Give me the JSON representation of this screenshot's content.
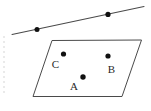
{
  "figure": {
    "type": "geometry-diagram",
    "background_color": "#ffffff",
    "stroke_color": "#4a4a4a",
    "point_color": "#111111",
    "label_color": "#2a2a2a",
    "canvas": {
      "width": 151,
      "height": 111
    },
    "line": {
      "name": "upper-line",
      "x1": 12,
      "y1": 34.5,
      "x2": 144,
      "y2": 6.5,
      "stroke_width": 1.1,
      "points": [
        {
          "id": "line-point-left",
          "cx": 37,
          "cy": 29.5,
          "r": 2.5,
          "label": ""
        },
        {
          "id": "line-point-right",
          "cx": 108,
          "cy": 14.4,
          "r": 2.6,
          "label": ""
        }
      ]
    },
    "parallelogram": {
      "name": "parallelogram",
      "stroke_width": 1.0,
      "fill": "none",
      "vertices": [
        {
          "id": "top-left",
          "x": 52,
          "y": 40.5
        },
        {
          "id": "top-right",
          "x": 141.5,
          "y": 40.0
        },
        {
          "id": "bottom-right",
          "x": 122,
          "y": 96.5
        },
        {
          "id": "bottom-left",
          "x": 33,
          "y": 96.5
        }
      ],
      "points": [
        {
          "id": "point-c",
          "label": "C",
          "cx": 63.5,
          "cy": 54.0,
          "r": 2.6,
          "label_x": 55.5,
          "label_y": 68.0,
          "label_anchor": "middle"
        },
        {
          "id": "point-b",
          "label": "B",
          "cx": 108.0,
          "cy": 56.0,
          "r": 2.6,
          "label_x": 111.5,
          "label_y": 73.0,
          "label_anchor": "middle"
        },
        {
          "id": "point-a",
          "label": "A",
          "cx": 83.0,
          "cy": 77.0,
          "r": 2.7,
          "label_x": 74.0,
          "label_y": 90.0,
          "label_anchor": "middle"
        }
      ]
    },
    "edge_artifact": {
      "name": "left-edge-artifact",
      "x": 4,
      "y_start": 36,
      "y_end": 94,
      "color": "#e2e2e2",
      "dash": "2 3",
      "stroke_width": 1.4
    }
  }
}
